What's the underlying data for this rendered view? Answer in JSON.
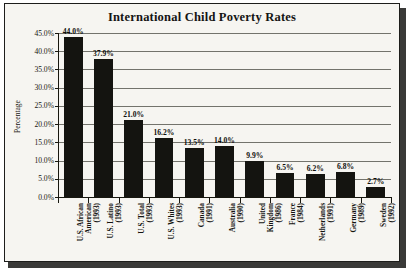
{
  "figure": {
    "title": "International Child Poverty Rates",
    "background_color": "#f6f5f1",
    "bar_color": "#141410",
    "frame_color": "#1d1d1b"
  },
  "chart_data": {
    "type": "bar",
    "title": "International Child Poverty Rates",
    "xlabel": "",
    "ylabel": "Percentage",
    "ylim": [
      0,
      45
    ],
    "grid": true,
    "legend": false,
    "categories": [
      "U.S. African American (1993)",
      "U.S. Latino (1993)",
      "U.S. Total (1993)",
      "U.S. Whites (1993)",
      "Canada (1991)",
      "Australia (1990)",
      "United Kingdom (1986)",
      "France (1984)",
      "Netherlands (1991)",
      "Germany (1989)",
      "Sweden (1992)"
    ],
    "category_lines": [
      [
        "U.S. African",
        "American",
        "(1993)"
      ],
      [
        "U.S. Latino",
        "(1993)"
      ],
      [
        "U.S. Total",
        "(1993)"
      ],
      [
        "U.S. Whites",
        "(1993)"
      ],
      [
        "Canada",
        "(1991)"
      ],
      [
        "Australia",
        "(1990)"
      ],
      [
        "United",
        "Kingdom",
        "(1986)"
      ],
      [
        "France",
        "(1984)"
      ],
      [
        "Netherlands",
        "(1991)"
      ],
      [
        "Germany",
        "(1989)"
      ],
      [
        "Sweden",
        "(1992)"
      ]
    ],
    "values": [
      44.0,
      37.9,
      21.0,
      16.2,
      13.5,
      14.0,
      9.9,
      6.5,
      6.2,
      6.8,
      2.7
    ],
    "value_labels": [
      "44.0%",
      "37.9%",
      "21.0%",
      "16.2%",
      "13.5%",
      "14.0%",
      "9.9%",
      "6.5%",
      "6.2%",
      "6.8%",
      "2.7%"
    ],
    "y_ticks": [
      0,
      5,
      10,
      15,
      20,
      25,
      30,
      35,
      40,
      45
    ],
    "y_tick_labels": [
      "0.0%",
      "5.0%",
      "10.0%",
      "15.0%",
      "20.0%",
      "25.0%",
      "30.0%",
      "35.0%",
      "40.0%",
      "45.0%"
    ]
  }
}
